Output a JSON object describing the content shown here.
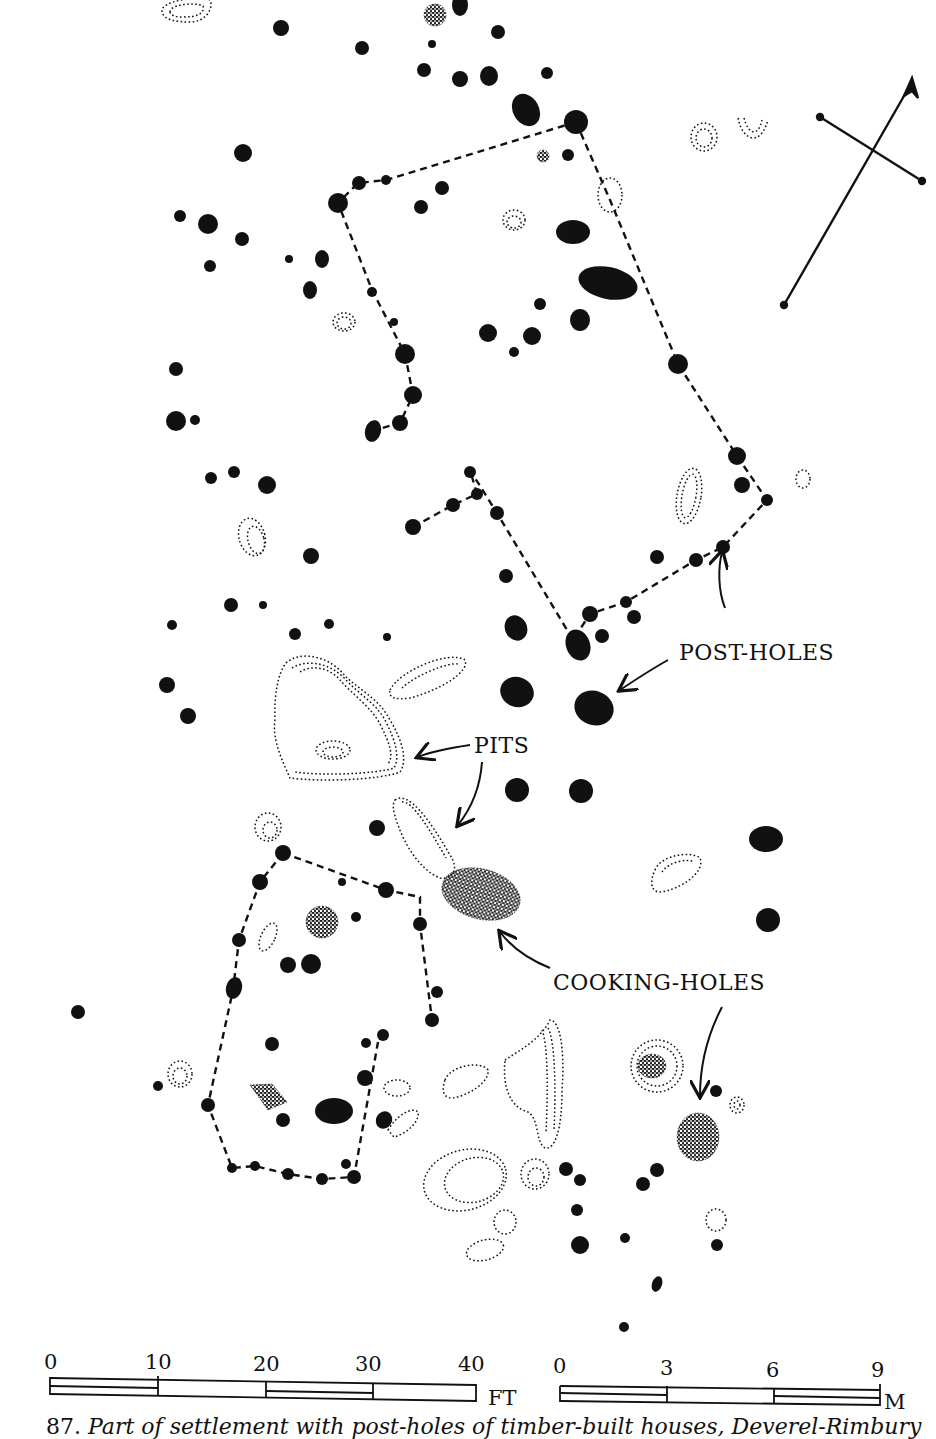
{
  "figure": {
    "number": "87.",
    "caption": "Part of settlement with post-holes of timber-built houses, Deverel-Rimbury"
  },
  "labels": {
    "post_holes": "POST-HOLES",
    "pits": "PITS",
    "cooking_holes": "COOKING-HOLES"
  },
  "scale_feet": {
    "ticks": [
      "0",
      "10",
      "20",
      "30",
      "40"
    ],
    "unit": "FT"
  },
  "scale_metres": {
    "ticks": [
      "0",
      "3",
      "6",
      "9"
    ],
    "unit": "M"
  },
  "north_arrow": {
    "present": true
  },
  "legend_colors": {
    "ink": "#111111",
    "paper": "#ffffff"
  }
}
